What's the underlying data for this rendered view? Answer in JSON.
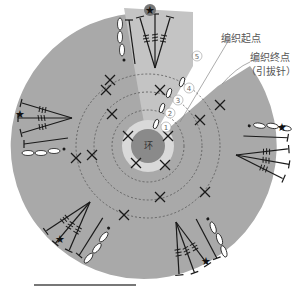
{
  "diagram": {
    "type": "crochet-chart",
    "center_label": "环",
    "rounds": [
      "1",
      "2",
      "3",
      "4",
      "5"
    ],
    "annotations": {
      "start_label": "编织起点",
      "end_label_line1": "编织终点",
      "end_label_line2": "（引拔针）"
    },
    "colors": {
      "outer_fill": "#a9a9a9",
      "wedge_fill": "#c4c4c4",
      "inner_ring_fill": "#d9d9d9",
      "center_fill": "#8a8a8a",
      "stitch_stroke": "#1a1a1a",
      "chain_fill": "#ffffff"
    },
    "petals": 6,
    "markers": "star"
  }
}
